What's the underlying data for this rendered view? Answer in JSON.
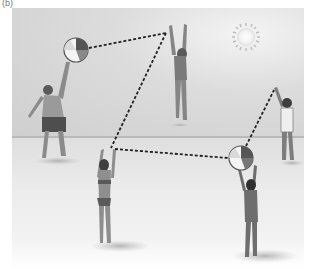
{
  "figure": {
    "panel_label": "(b)"
  },
  "colors": {
    "sky": "#d4d4d4",
    "sand": "#ececec",
    "horizon": "#b9b9b9",
    "path": "#222222",
    "ball_dark": "#555555",
    "skin": "#8a8a8a"
  },
  "scene": {
    "sun": {
      "x": 246,
      "y": 37,
      "r": 10
    },
    "balls": [
      {
        "name": "ball-upper-left",
        "x": 76,
        "y": 50,
        "r": 12
      },
      {
        "name": "ball-lower-right",
        "x": 241,
        "y": 158,
        "r": 12
      }
    ],
    "pass_path": [
      {
        "x1": 89,
        "y1": 48,
        "x2": 166,
        "y2": 33
      },
      {
        "x1": 166,
        "y1": 33,
        "x2": 111,
        "y2": 148
      },
      {
        "x1": 115,
        "y1": 149,
        "x2": 228,
        "y2": 158
      },
      {
        "x1": 246,
        "y1": 146,
        "x2": 274,
        "y2": 90
      }
    ],
    "players": [
      {
        "name": "man-serving",
        "x": 55,
        "y": 60
      },
      {
        "name": "woman-jumping",
        "x": 178,
        "y": 30
      },
      {
        "name": "boy-right",
        "x": 283,
        "y": 90
      },
      {
        "name": "woman-bikini-center",
        "x": 103,
        "y": 148
      },
      {
        "name": "woman-holding-ball",
        "x": 248,
        "y": 175
      }
    ]
  }
}
